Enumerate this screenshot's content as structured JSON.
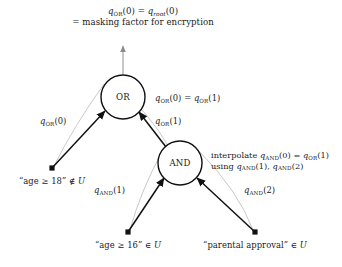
{
  "figure": {
    "kind": "access-tree-diagram",
    "background_color": "#ffffff",
    "edge_color": "#111111",
    "arc_color": "#b0b0b0",
    "node_stroke_color": "#111111",
    "text_color": "#1a1a1a"
  },
  "root_annotation": {
    "line1_a": "q",
    "line1_a_sub": "OR",
    "line1_b": "(0) = ",
    "line1_c": "q",
    "line1_c_sub": "root",
    "line1_d": "(0)",
    "line2": "= masking factor for encryption"
  },
  "nodes": [
    {
      "id": "or-node",
      "label": "OR",
      "cx": 123,
      "cy": 97,
      "r": 22,
      "type": "gate"
    },
    {
      "id": "and-node",
      "label": "AND",
      "cx": 180,
      "cy": 163,
      "r": 22,
      "type": "gate"
    }
  ],
  "leaves": [
    {
      "id": "leaf-age-18",
      "text_quote": "“age ≥ 18”",
      "text_rel": " ∉ ",
      "text_set": "U",
      "dot_x": 52,
      "dot_y": 168,
      "label_x": 52,
      "label_y": 176
    },
    {
      "id": "leaf-age-16",
      "text_quote": "“age ≥ 16”",
      "text_rel": " ∈ ",
      "text_set": "U",
      "dot_x": 128,
      "dot_y": 232,
      "label_x": 128,
      "label_y": 240
    },
    {
      "id": "leaf-parental-approval",
      "text_quote": "“parental approval”",
      "text_rel": " ∈ ",
      "text_set": "U",
      "dot_x": 255,
      "dot_y": 232,
      "label_x": 255,
      "label_y": 240
    }
  ],
  "edge_labels": {
    "or_left": {
      "base": "q",
      "sub": "OR",
      "arg": "(0)",
      "x": 40,
      "y": 121
    },
    "or_right": {
      "base": "q",
      "sub": "OR",
      "arg": "(1)",
      "x": 157,
      "y": 121
    },
    "and_left": {
      "base": "q",
      "sub": "AND",
      "arg": "(1)",
      "x": 97,
      "y": 190
    },
    "and_right": {
      "base": "q",
      "sub": "AND",
      "arg": "(2)",
      "x": 247,
      "y": 190
    }
  },
  "or_output_label": {
    "base1": "q",
    "sub1": "OR",
    "arg1": "(0) = ",
    "base2": "q",
    "sub2": "OR",
    "arg2": "(1)",
    "x": 155,
    "y": 93
  },
  "and_annotation": {
    "line1_pre": "interpolate ",
    "line1_a": "q",
    "line1_a_sub": "AND",
    "line1_b": "(0) = ",
    "line1_c": "q",
    "line1_c_sub": "OR",
    "line1_d": "(1)",
    "line2_pre": "using ",
    "line2_a": "q",
    "line2_a_sub": "AND",
    "line2_b": "(1), ",
    "line2_c": "q",
    "line2_c_sub": "AND",
    "line2_d": "(2)",
    "x": 211,
    "y": 150
  }
}
